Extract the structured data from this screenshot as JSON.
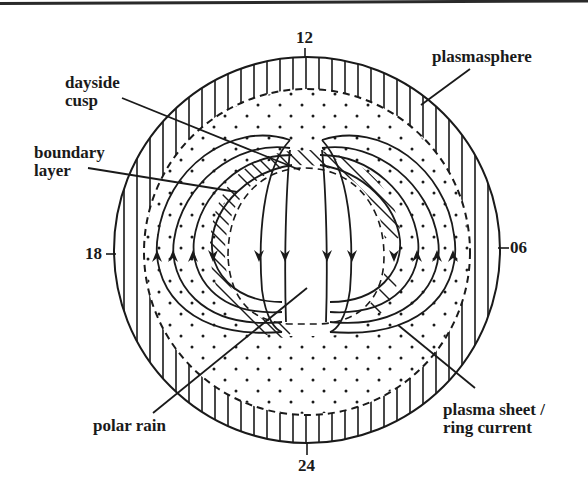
{
  "figure": {
    "title": ""
  },
  "clock_markers": {
    "top": "12",
    "bottom": "24",
    "left": "18",
    "right": "06"
  },
  "labels": {
    "dayside_cusp": {
      "line1": "dayside",
      "line2": "cusp"
    },
    "boundary_layer": {
      "line1": "boundary",
      "line2": "layer"
    },
    "plasmasphere": {
      "line1": "plasmasphere"
    },
    "polar_rain": {
      "line1": "polar rain"
    },
    "plasma_sheet": {
      "line1": "plasma sheet /",
      "line2": "ring current"
    }
  },
  "style": {
    "ink": "#1a1a1a",
    "background": "#ffffff"
  },
  "regions": [
    "plasmasphere (vertical hatch ring)",
    "plasma sheet / ring current (dotted ring)",
    "boundary layer (diagonal hatch crescent)",
    "polar cap / polar rain (clear center)",
    "dayside cusp"
  ],
  "convection": {
    "central_flow_direction": "down (antisunward, 12 toward 24)",
    "flank_flow_direction": "up (sunward, 24 toward 12)",
    "central_arrows": 4,
    "left_flank_arrows": 4,
    "right_flank_arrows": 4
  }
}
